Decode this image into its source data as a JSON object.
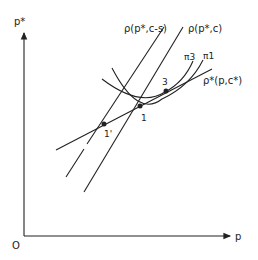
{
  "diagram": {
    "axes": {
      "y_label": "p*",
      "x_label": "p",
      "origin_label": "O"
    },
    "curves": [
      {
        "id": "rho_cs",
        "label": "ρ(p*,c-s)"
      },
      {
        "id": "rho_c",
        "label": "ρ(p*,c)"
      },
      {
        "id": "rho_star",
        "label": "ρ*(p,c*)"
      },
      {
        "id": "pi3",
        "label": "π3"
      },
      {
        "id": "pi1",
        "label": "π1"
      }
    ],
    "points": [
      {
        "id": "p1",
        "label": "1"
      },
      {
        "id": "p3",
        "label": "3"
      },
      {
        "id": "p1prime",
        "label": "1'"
      }
    ]
  }
}
